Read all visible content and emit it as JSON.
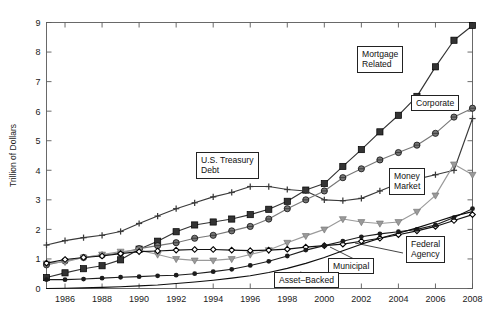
{
  "chart_data": {
    "type": "line",
    "title": "",
    "xlabel": "",
    "ylabel": "Trillion of Dollars",
    "xlim": [
      1985,
      2008
    ],
    "ylim": [
      0,
      9
    ],
    "ytick_labels": [
      "0",
      "1",
      "2",
      "3",
      "4",
      "5",
      "6",
      "7",
      "8",
      "9"
    ],
    "xtick_labels": [
      "1986",
      "1988",
      "1990",
      "1992",
      "1994",
      "1996",
      "1998",
      "2000",
      "2002",
      "2004",
      "2006",
      "2008"
    ],
    "grid": false,
    "legend_position": "annotations-in-plot",
    "x": [
      1985,
      1986,
      1987,
      1988,
      1989,
      1990,
      1991,
      1992,
      1993,
      1994,
      1995,
      1996,
      1997,
      1998,
      1999,
      2000,
      2001,
      2002,
      2003,
      2004,
      2005,
      2006,
      2007,
      2008
    ],
    "series": [
      {
        "name": "Mortgage Related",
        "marker": "square",
        "color": "#333333",
        "values": [
          0.37,
          0.53,
          0.67,
          0.77,
          0.97,
          1.33,
          1.6,
          1.92,
          2.15,
          2.25,
          2.35,
          2.5,
          2.68,
          2.95,
          3.33,
          3.55,
          4.13,
          4.7,
          5.3,
          5.86,
          6.5,
          7.5,
          8.4,
          8.9
        ]
      },
      {
        "name": "U.S. Treasury Debt",
        "marker": "plus",
        "color": "#3a3a3a",
        "values": [
          1.47,
          1.62,
          1.72,
          1.8,
          1.93,
          2.2,
          2.45,
          2.7,
          2.9,
          3.1,
          3.25,
          3.45,
          3.45,
          3.35,
          3.3,
          3.0,
          2.97,
          3.05,
          3.3,
          3.55,
          3.7,
          3.85,
          4.0,
          5.75
        ]
      },
      {
        "name": "Corporate",
        "marker": "circle",
        "color": "#777777",
        "values": [
          0.8,
          0.93,
          1.05,
          1.13,
          1.2,
          1.35,
          1.45,
          1.55,
          1.7,
          1.8,
          1.95,
          2.1,
          2.35,
          2.7,
          3.0,
          3.3,
          3.75,
          4.05,
          4.35,
          4.6,
          4.85,
          5.25,
          5.8,
          6.1
        ]
      },
      {
        "name": "Money Market",
        "marker": "triangle-down",
        "color": "#9a9a9a",
        "values": [
          0.85,
          0.9,
          1.05,
          1.15,
          1.25,
          1.3,
          1.15,
          1.0,
          0.95,
          0.95,
          1.0,
          1.15,
          1.3,
          1.55,
          1.78,
          2.0,
          2.35,
          2.25,
          2.2,
          2.25,
          2.6,
          3.15,
          4.2,
          3.85
        ]
      },
      {
        "name": "Municipal",
        "marker": "diamond",
        "color": "#121212",
        "values": [
          0.86,
          0.98,
          1.05,
          1.1,
          1.18,
          1.25,
          1.27,
          1.3,
          1.32,
          1.32,
          1.3,
          1.28,
          1.3,
          1.33,
          1.4,
          1.45,
          1.5,
          1.6,
          1.7,
          1.82,
          1.95,
          2.1,
          2.3,
          2.5
        ]
      },
      {
        "name": "Federal Agency",
        "marker": "dot",
        "color": "#1c1c1c",
        "values": [
          0.3,
          0.3,
          0.32,
          0.35,
          0.38,
          0.4,
          0.43,
          0.45,
          0.5,
          0.57,
          0.65,
          0.78,
          0.92,
          1.1,
          1.3,
          1.45,
          1.6,
          1.75,
          1.85,
          1.92,
          2.0,
          2.15,
          2.4,
          2.7
        ]
      },
      {
        "name": "Asset-Backed",
        "marker": "none",
        "color": "#0d0d0d",
        "values": [
          0.0,
          0.01,
          0.02,
          0.04,
          0.06,
          0.09,
          0.12,
          0.17,
          0.22,
          0.28,
          0.35,
          0.43,
          0.54,
          0.68,
          0.85,
          1.05,
          1.28,
          1.5,
          1.7,
          1.87,
          2.05,
          2.25,
          2.45,
          2.6
        ]
      }
    ]
  },
  "annotations": [
    {
      "name": "mortgage-related",
      "label": "Mortgage\nRelated"
    },
    {
      "name": "corporate",
      "label": "Corporate"
    },
    {
      "name": "us-treasury-debt",
      "label": "U.S. Treasury\nDebt"
    },
    {
      "name": "money-market",
      "label": "Money\nMarket"
    },
    {
      "name": "federal-agency",
      "label": "Federal\nAgency"
    },
    {
      "name": "municipal",
      "label": "Municipal"
    },
    {
      "name": "asset-backed",
      "label": "Asset–Backed"
    }
  ]
}
